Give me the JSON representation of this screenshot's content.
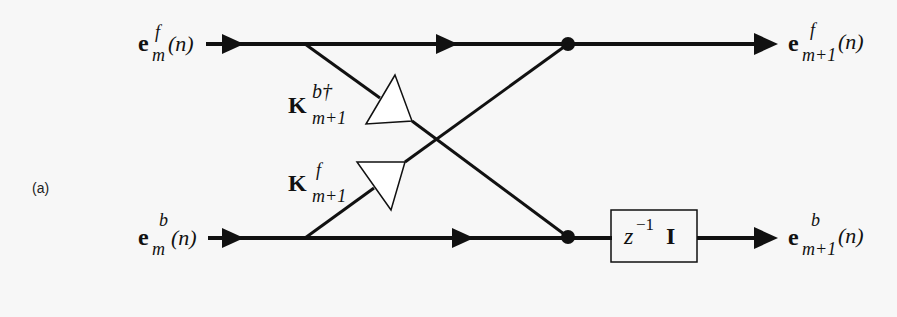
{
  "panel_label": "(a)",
  "inputs": {
    "forward": {
      "base": "e",
      "sup": "f",
      "sub": "m",
      "arg": "(n)"
    },
    "backward": {
      "base": "e",
      "sup": "b",
      "sub": "m",
      "arg": "(n)"
    }
  },
  "outputs": {
    "forward": {
      "base": "e",
      "sup": "f",
      "sub": "m+1",
      "arg": "(n)"
    },
    "backward": {
      "base": "e",
      "sup": "b",
      "sub": "m+1",
      "arg": "(n)"
    }
  },
  "gains": {
    "backward_reflection": {
      "base": "K",
      "sup": "b†",
      "sub": "m+1"
    },
    "forward_reflection": {
      "base": "K",
      "sup": "f",
      "sub": "m+1"
    }
  },
  "delay_block": {
    "z": "z",
    "exp": "−1",
    "matrix": "I"
  },
  "colors": {
    "line": "#111111",
    "background": "#f7f7f7",
    "triangle_fill": "#ffffff"
  }
}
